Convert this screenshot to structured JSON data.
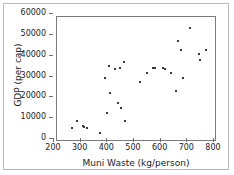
{
  "chart_data": {
    "type": "scatter",
    "title": "",
    "xlabel": "Muni Waste (kg/person)",
    "ylabel": "GDP (per cap)",
    "xlim": [
      200,
      800
    ],
    "ylim": [
      0,
      60000
    ],
    "xticks": [
      200,
      300,
      400,
      500,
      600,
      700,
      800
    ],
    "yticks": [
      0,
      10000,
      20000,
      30000,
      40000,
      50000,
      60000
    ],
    "xtick_labels": [
      "200",
      "300",
      "400",
      "500",
      "600",
      "700",
      "800"
    ],
    "ytick_labels": [
      "0",
      "10000",
      "20000",
      "30000",
      "40000",
      "50000",
      "60000"
    ],
    "grid": false,
    "legend": null,
    "marker_color": "#3a3a3a",
    "points": [
      {
        "x": 258,
        "y": 6600
      },
      {
        "x": 276,
        "y": 10300
      },
      {
        "x": 296,
        "y": 7800
      },
      {
        "x": 303,
        "y": 7100
      },
      {
        "x": 314,
        "y": 6700
      },
      {
        "x": 363,
        "y": 4400
      },
      {
        "x": 380,
        "y": 30900
      },
      {
        "x": 386,
        "y": 14100
      },
      {
        "x": 396,
        "y": 36500
      },
      {
        "x": 398,
        "y": 23700
      },
      {
        "x": 418,
        "y": 35100
      },
      {
        "x": 427,
        "y": 18800
      },
      {
        "x": 436,
        "y": 35300
      },
      {
        "x": 441,
        "y": 16100
      },
      {
        "x": 452,
        "y": 38400
      },
      {
        "x": 456,
        "y": 10000
      },
      {
        "x": 513,
        "y": 28800
      },
      {
        "x": 537,
        "y": 33100
      },
      {
        "x": 559,
        "y": 35600
      },
      {
        "x": 566,
        "y": 35300
      },
      {
        "x": 597,
        "y": 35400
      },
      {
        "x": 606,
        "y": 35200
      },
      {
        "x": 627,
        "y": 33300
      },
      {
        "x": 645,
        "y": 24300
      },
      {
        "x": 655,
        "y": 48500
      },
      {
        "x": 666,
        "y": 44300
      },
      {
        "x": 672,
        "y": 30500
      },
      {
        "x": 697,
        "y": 54500
      },
      {
        "x": 731,
        "y": 42100
      },
      {
        "x": 737,
        "y": 39600
      },
      {
        "x": 760,
        "y": 44400
      }
    ]
  }
}
